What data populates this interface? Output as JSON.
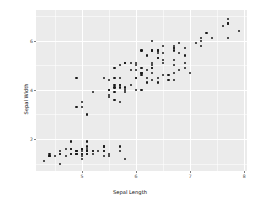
{
  "chart_data": {
    "type": "scatter",
    "title": "",
    "xlabel": "Sepal Length",
    "ylabel": "Sepal Width",
    "xlim": [
      4.15,
      8.05
    ],
    "ylim": [
      0.7,
      7.25
    ],
    "xticks": [
      5,
      6,
      7,
      8
    ],
    "xticklabels": [
      "5",
      "6",
      "7",
      "8"
    ],
    "yticks": [
      2,
      4,
      6
    ],
    "yticklabels": [
      "2",
      "4",
      "6"
    ],
    "x_minor_ticks": [
      4.5,
      5.5,
      6.5,
      7.5
    ],
    "y_minor_ticks": [
      1,
      3,
      5,
      7
    ],
    "grid": true,
    "legend": "none",
    "point_color": "#1a1a1a",
    "panel_background": "#ebebeb",
    "gridline_color": "#ffffff",
    "plot_background": "#ffffff",
    "n_points": 150,
    "x": [
      5.1,
      4.9,
      4.7,
      4.6,
      5.0,
      5.4,
      4.6,
      5.0,
      4.4,
      4.9,
      5.4,
      4.8,
      4.8,
      4.3,
      5.8,
      5.7,
      5.4,
      5.1,
      5.7,
      5.1,
      5.4,
      5.1,
      4.6,
      5.1,
      4.8,
      5.0,
      5.0,
      5.2,
      5.2,
      4.7,
      4.8,
      5.4,
      5.2,
      5.5,
      4.9,
      5.0,
      5.5,
      4.9,
      4.4,
      5.1,
      5.0,
      4.5,
      4.4,
      5.0,
      5.1,
      4.8,
      5.1,
      4.6,
      5.3,
      5.0,
      7.0,
      6.4,
      6.9,
      5.5,
      6.5,
      5.7,
      6.3,
      4.9,
      6.6,
      5.2,
      5.0,
      5.9,
      6.0,
      6.1,
      5.6,
      6.7,
      5.6,
      5.8,
      6.2,
      5.6,
      5.9,
      6.1,
      6.3,
      6.1,
      6.4,
      6.6,
      6.8,
      6.7,
      6.0,
      5.7,
      5.5,
      5.5,
      5.8,
      6.0,
      5.4,
      6.0,
      6.7,
      6.3,
      5.6,
      5.5,
      5.5,
      6.1,
      5.8,
      5.0,
      5.6,
      5.7,
      5.7,
      6.2,
      5.1,
      5.7,
      6.3,
      5.8,
      7.1,
      6.3,
      6.5,
      7.6,
      4.9,
      7.3,
      6.7,
      7.2,
      6.5,
      6.4,
      6.8,
      5.7,
      5.8,
      6.4,
      6.5,
      7.7,
      7.7,
      6.0,
      6.9,
      5.6,
      7.7,
      6.3,
      6.7,
      7.2,
      6.2,
      6.1,
      6.4,
      7.2,
      7.4,
      7.9,
      6.4,
      6.3,
      6.1,
      7.7,
      6.3,
      6.4,
      6.0,
      6.9,
      6.7,
      6.9,
      5.8,
      6.8,
      6.7,
      6.7,
      6.3,
      6.5,
      6.2,
      5.9
    ],
    "y": [
      1.4,
      1.4,
      1.3,
      1.5,
      1.4,
      1.7,
      1.4,
      1.5,
      1.4,
      1.5,
      1.5,
      1.6,
      1.4,
      1.1,
      1.2,
      1.5,
      1.3,
      1.4,
      1.7,
      1.5,
      1.7,
      1.5,
      1.0,
      1.7,
      1.9,
      1.6,
      1.6,
      1.5,
      1.4,
      1.6,
      1.6,
      1.5,
      1.5,
      1.4,
      1.5,
      1.2,
      1.3,
      1.4,
      1.3,
      1.5,
      1.3,
      1.3,
      1.3,
      1.6,
      1.9,
      1.4,
      1.6,
      1.4,
      1.5,
      1.4,
      4.7,
      4.5,
      4.9,
      4.0,
      4.6,
      4.5,
      4.7,
      3.3,
      4.6,
      3.9,
      3.5,
      4.2,
      4.0,
      4.7,
      3.6,
      4.4,
      4.5,
      4.1,
      4.5,
      3.9,
      4.8,
      4.0,
      4.9,
      4.7,
      4.3,
      4.4,
      4.8,
      5.0,
      4.5,
      3.5,
      3.8,
      3.7,
      3.9,
      5.1,
      4.5,
      4.5,
      4.7,
      4.4,
      4.1,
      4.0,
      4.4,
      4.6,
      4.0,
      3.3,
      4.2,
      4.2,
      4.2,
      4.3,
      3.0,
      4.1,
      6.0,
      5.1,
      5.9,
      5.6,
      5.8,
      6.6,
      4.5,
      6.3,
      5.8,
      6.1,
      5.1,
      5.3,
      5.5,
      5.0,
      5.1,
      5.3,
      5.5,
      6.7,
      6.9,
      5.0,
      5.7,
      4.9,
      6.7,
      4.9,
      5.7,
      6.0,
      4.8,
      4.9,
      5.6,
      5.8,
      6.1,
      6.4,
      5.6,
      5.1,
      5.6,
      6.1,
      5.6,
      5.5,
      4.8,
      5.4,
      5.6,
      5.1,
      5.1,
      5.9,
      5.7,
      5.2,
      5.0,
      5.2,
      5.4,
      5.1
    ]
  }
}
